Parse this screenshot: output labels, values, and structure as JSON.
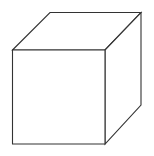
{
  "diagram": {
    "shape": "cube",
    "view": "oblique wireframe (hidden edges omitted)",
    "stroke_color": "#333333",
    "stroke_width": 1.1,
    "fill_color": "#ffffff",
    "background": "#ffffff",
    "vertices": {
      "front_top_left": [
        12.5,
        50
      ],
      "front_top_right": [
        105,
        50
      ],
      "front_bottom_right": [
        105,
        144
      ],
      "front_bottom_left": [
        12.5,
        144
      ],
      "back_top_left": [
        50,
        12.5
      ],
      "back_top_right": [
        141,
        12.5
      ],
      "back_bottom_right": [
        141,
        105
      ]
    },
    "faces": [
      {
        "name": "front-face",
        "points": "12.5,50 105,50 105,144 12.5,144"
      },
      {
        "name": "top-face",
        "points": "12.5,50 50,12.5 141,12.5 105,50"
      },
      {
        "name": "right-face",
        "points": "105,50 141,12.5 141,105 105,144"
      }
    ]
  }
}
